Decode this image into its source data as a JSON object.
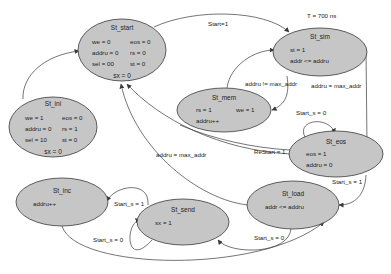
{
  "diagram": {
    "type": "state_machine",
    "states": [
      {
        "id": "St_start",
        "name": "St_start",
        "lines": [
          [
            "we = 0",
            "eos = 0"
          ],
          [
            "addru = 0",
            "rs = 0"
          ],
          [
            "sel = 00",
            "st = 0"
          ]
        ],
        "footer": "sx = 0"
      },
      {
        "id": "St_ini",
        "name": "St_ini",
        "lines": [
          [
            "we = 1",
            "eos = 0"
          ],
          [
            "addru = 0",
            "rs = 1"
          ],
          [
            "sel = 10",
            "st = 0"
          ]
        ],
        "footer": "sx = 0"
      },
      {
        "id": "St_sim",
        "name": "St_sim",
        "lines": [
          [
            "st = 1"
          ],
          [
            "addr <= addru"
          ]
        ]
      },
      {
        "id": "St_mem",
        "name": "St_mem",
        "lines": [
          [
            "rs = 1",
            "we = 1"
          ],
          [
            "addru++"
          ]
        ]
      },
      {
        "id": "St_eos",
        "name": "St_eos",
        "lines": [
          [
            "eos = 1"
          ],
          [
            "addru = 0"
          ]
        ]
      },
      {
        "id": "St_load",
        "name": "St_load",
        "lines": [
          [
            "addr <= addru"
          ]
        ]
      },
      {
        "id": "St_send",
        "name": "St_send",
        "lines": [
          [
            "sx = 1"
          ]
        ]
      },
      {
        "id": "St_inc",
        "name": "St_inc",
        "lines": [
          [
            "addru++"
          ]
        ]
      }
    ],
    "edges": [
      {
        "from": "St_ini",
        "to": "St_start",
        "label": ""
      },
      {
        "from": "St_start",
        "to": "St_sim",
        "label": "Start=1"
      },
      {
        "from": "St_sim",
        "to": "St_mem",
        "label": "addru != max_addr"
      },
      {
        "from": "St_mem",
        "to": "St_sim",
        "label": ""
      },
      {
        "from": "St_sim",
        "to": "St_eos",
        "label": "addru = max_addr"
      },
      {
        "from": "St_eos",
        "to": "St_eos",
        "label": "Start_s = 0"
      },
      {
        "from": "St_eos",
        "to": "St_start",
        "label": "ReStart = 1"
      },
      {
        "from": "St_eos",
        "to": "St_load",
        "label": "Start_s = 1"
      },
      {
        "from": "St_load",
        "to": "St_start",
        "label": "addru = max_addr"
      },
      {
        "from": "St_load",
        "to": "St_send",
        "label": "Start_s = 0"
      },
      {
        "from": "St_send",
        "to": "St_send",
        "label": "Start_s = 0"
      },
      {
        "from": "St_send",
        "to": "St_inc",
        "label": "Start_s = 1"
      },
      {
        "from": "St_inc",
        "to": "St_load",
        "label": ""
      }
    ],
    "annotations": [
      {
        "text": "T = 700 ns",
        "near": "St_sim"
      }
    ],
    "colors": {
      "state_fill": "#c6c6c6",
      "stroke": "#3a3a3a",
      "background": "#ffffff"
    }
  }
}
